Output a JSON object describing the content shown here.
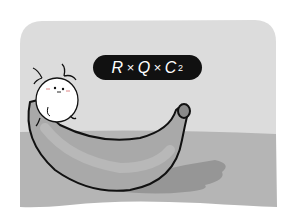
{
  "illustration": {
    "description": "Cartoon panel: small white horned creature sitting on a large banana",
    "colors": {
      "background": "#ffffff",
      "wall": "#dcdcdc",
      "floor": "#b5b5b5",
      "banana": "#a9a9a9",
      "banana_stem": "#8a8a8a",
      "shadow": "#969696",
      "outline": "#111111",
      "creature": "#ffffff"
    }
  },
  "label": {
    "r": "R",
    "times1": "×",
    "q": "Q",
    "times2": "×",
    "c": "C",
    "subscript": "2"
  }
}
